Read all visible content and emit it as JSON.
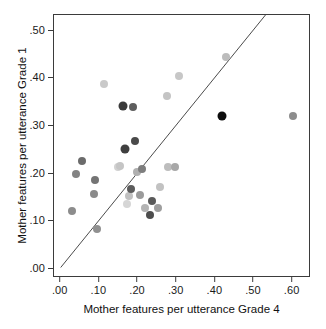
{
  "chart_data": {
    "type": "scatter",
    "title": "",
    "xlabel": "Mother features per utterance Grade 4",
    "ylabel": "Mother features per utterance Grade 1",
    "xlim": [
      -0.0175,
      0.6475
    ],
    "ylim": [
      -0.018,
      0.534
    ],
    "xticks": [
      0.0,
      0.1,
      0.2,
      0.3,
      0.4,
      0.5,
      0.6
    ],
    "xticklabels": [
      ".00",
      ".10",
      ".20",
      ".30",
      ".40",
      ".50",
      ".60"
    ],
    "yticks": [
      0.0,
      0.1,
      0.2,
      0.3,
      0.4,
      0.5
    ],
    "yticklabels": [
      ".00",
      ".10",
      ".20",
      ".30",
      ".40",
      ".50"
    ],
    "grid": false,
    "legend": null,
    "annotations": [
      {
        "name": "identity-reference-line",
        "type": "line",
        "description": "diagonal y = x reference line",
        "x": [
          0.0,
          0.534
        ],
        "y": [
          0.0,
          0.534
        ],
        "color": "#4a4a4a"
      }
    ],
    "marker": {
      "shape": "circle",
      "size_px": 8,
      "size_px_large": 9
    },
    "points": [
      {
        "x": 0.028,
        "y": 0.123,
        "color": "#8c8c8c",
        "size": 8
      },
      {
        "x": 0.04,
        "y": 0.2,
        "color": "#838383",
        "size": 8
      },
      {
        "x": 0.056,
        "y": 0.228,
        "color": "#6b6b6b",
        "size": 8
      },
      {
        "x": 0.085,
        "y": 0.159,
        "color": "#8a8a8a",
        "size": 8
      },
      {
        "x": 0.089,
        "y": 0.188,
        "color": "#747474",
        "size": 8
      },
      {
        "x": 0.095,
        "y": 0.085,
        "color": "#909090",
        "size": 8
      },
      {
        "x": 0.112,
        "y": 0.389,
        "color": "#c9c9c9",
        "size": 8
      },
      {
        "x": 0.148,
        "y": 0.214,
        "color": "#d2d2d2",
        "size": 8
      },
      {
        "x": 0.153,
        "y": 0.217,
        "color": "#c5c5c5",
        "size": 8
      },
      {
        "x": 0.16,
        "y": 0.344,
        "color": "#3a3a3a",
        "size": 9
      },
      {
        "x": 0.165,
        "y": 0.253,
        "color": "#3f3f3f",
        "size": 9
      },
      {
        "x": 0.171,
        "y": 0.138,
        "color": "#d6d6d6",
        "size": 8
      },
      {
        "x": 0.176,
        "y": 0.155,
        "color": "#c0c0c0",
        "size": 8
      },
      {
        "x": 0.181,
        "y": 0.168,
        "color": "#5c5c5c",
        "size": 8
      },
      {
        "x": 0.187,
        "y": 0.341,
        "color": "#5e5e5e",
        "size": 8
      },
      {
        "x": 0.192,
        "y": 0.27,
        "color": "#4a4a4a",
        "size": 8
      },
      {
        "x": 0.198,
        "y": 0.204,
        "color": "#b0b0b0",
        "size": 8
      },
      {
        "x": 0.205,
        "y": 0.157,
        "color": "#9b9b9b",
        "size": 8
      },
      {
        "x": 0.211,
        "y": 0.211,
        "color": "#7e7e7e",
        "size": 8
      },
      {
        "x": 0.219,
        "y": 0.128,
        "color": "#b4b4b4",
        "size": 8
      },
      {
        "x": 0.231,
        "y": 0.115,
        "color": "#4d4d4d",
        "size": 8
      },
      {
        "x": 0.236,
        "y": 0.143,
        "color": "#5a5a5a",
        "size": 8
      },
      {
        "x": 0.252,
        "y": 0.129,
        "color": "#9e9e9e",
        "size": 8
      },
      {
        "x": 0.256,
        "y": 0.173,
        "color": "#c2c2c2",
        "size": 8
      },
      {
        "x": 0.275,
        "y": 0.364,
        "color": "#c4c4c4",
        "size": 8
      },
      {
        "x": 0.277,
        "y": 0.215,
        "color": "#bdbdbd",
        "size": 8
      },
      {
        "x": 0.295,
        "y": 0.216,
        "color": "#a8a8a8",
        "size": 8
      },
      {
        "x": 0.306,
        "y": 0.405,
        "color": "#c7c7c7",
        "size": 8
      },
      {
        "x": 0.418,
        "y": 0.321,
        "color": "#0d0d0d",
        "size": 9
      },
      {
        "x": 0.428,
        "y": 0.445,
        "color": "#bcbcbc",
        "size": 8
      },
      {
        "x": 0.6,
        "y": 0.321,
        "color": "#8d8d8d",
        "size": 8
      }
    ]
  }
}
